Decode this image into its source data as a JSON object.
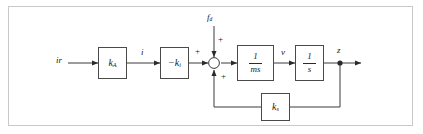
{
  "figure": {
    "kind": "control-block-diagram",
    "border_color": "#c9c9c9",
    "line_color": "#3a3a3a",
    "background": "#ffffff"
  },
  "signals": {
    "input": "ir",
    "current": "i",
    "disturbance_num": "f",
    "disturbance_sub": "d",
    "velocity": "v",
    "output": "z"
  },
  "blocks": {
    "amplifier": {
      "base": "k",
      "sub": "A"
    },
    "force_gain": {
      "prefix": "−",
      "base": "k",
      "sub": "i"
    },
    "mass": {
      "numerator": "1",
      "denominator": "ms"
    },
    "integrator": {
      "numerator": "1",
      "denominator": "s"
    },
    "feedback": {
      "base": "k",
      "sub": "s"
    }
  },
  "summing_junction": {
    "sign_left": "+",
    "sign_top": "+",
    "sign_bottom": "+"
  }
}
